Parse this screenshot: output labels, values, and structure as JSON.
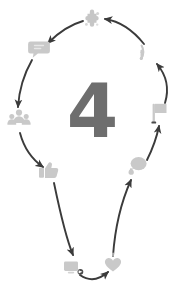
{
  "diagram": {
    "title": "4",
    "shape": "lightbulb-cycle",
    "direction": "counter-clockwise",
    "colors": {
      "background": "#ffffff",
      "arrow": "#3b3b3b",
      "icon": "#c9c9c9",
      "icon_dark": "#b8b8b8",
      "number": "#6e6e6e"
    },
    "center": {
      "value": "4"
    },
    "nodes": [
      {
        "id": "node-top",
        "icon": "puzzle-piece-icon",
        "label": "Puzzle",
        "x": 92,
        "y": 19
      },
      {
        "id": "node-upper-left",
        "icon": "chat-bubble-icon",
        "label": "Chat",
        "x": 39,
        "y": 48
      },
      {
        "id": "node-left",
        "icon": "users-group-icon",
        "label": "Community",
        "x": 19,
        "y": 119
      },
      {
        "id": "node-lower-left",
        "icon": "thumbs-up-icon",
        "label": "Like",
        "x": 48,
        "y": 170
      },
      {
        "id": "node-bottom-left",
        "icon": "share-screen-icon",
        "label": "Share",
        "x": 73,
        "y": 267
      },
      {
        "id": "node-bottom-right",
        "icon": "heart-icon",
        "label": "Favorite",
        "x": 113,
        "y": 265
      },
      {
        "id": "node-lower-right",
        "icon": "comment-bubble-icon",
        "label": "Comment",
        "x": 138,
        "y": 166
      },
      {
        "id": "node-right",
        "icon": "flag-icon",
        "label": "Flag",
        "x": 159,
        "y": 113
      },
      {
        "id": "node-upper-right",
        "icon": "rss-signal-icon",
        "label": "Feed",
        "x": 148,
        "y": 52
      }
    ]
  }
}
